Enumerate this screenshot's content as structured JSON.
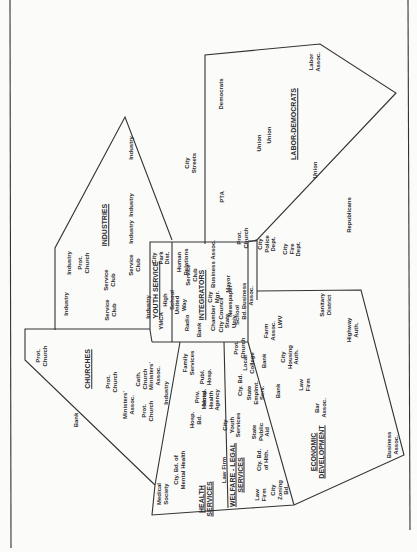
{
  "diagram": {
    "orientation": "rotated-90-ccw",
    "line_color": "#333333",
    "background": "#fbfbfa",
    "groups": [
      {
        "id": "industries",
        "title": "INDUSTRIES",
        "members": [
          "Industry",
          "Industry",
          "Industry",
          "Industry",
          "Industry",
          "Prot. Church",
          "Service Club",
          "Service Club",
          "Service Club"
        ]
      },
      {
        "id": "labor-democrats",
        "title": "LABOR-DEMOCRATS",
        "members": [
          "Democrats",
          "Union",
          "Union",
          "Union",
          "Labor Assoc.",
          "PTA"
        ]
      },
      {
        "id": "churches",
        "title": "CHURCHES",
        "members": [
          "Prot. Church",
          "Prot. Church",
          "Prot. Church",
          "Cath. Church",
          "Ministers' Assoc.",
          "Ministers' Assoc.",
          "Industry",
          "Bank",
          "Medical Society"
        ]
      },
      {
        "id": "youth-service",
        "title": "YOUTH SERVICE",
        "members": [
          "City Park Dist.",
          "High School",
          "United Way",
          "YMCA",
          "Industry"
        ]
      },
      {
        "id": "integrators",
        "title": "INTEGRATORS",
        "members": [
          "Human Relations",
          "Service Club",
          "Business Assoc.",
          "City Mgr.",
          "Mayor",
          "Chamber",
          "Newspaper",
          "City Council",
          "State Univ.",
          "School Bd.",
          "Business Assoc.",
          "Radio",
          "Bank",
          "Prot. Church"
        ]
      },
      {
        "id": "health-services",
        "title": "HEALTH SERVICES",
        "members": [
          "Medical Society",
          "Cty. Bd. of Mental Health",
          "Hosp. Bd.",
          "Priv. Hosp.",
          "Publ. Hosp.",
          "Family Services",
          "Mental Health Agency"
        ]
      },
      {
        "id": "welfare-legal",
        "title": "WELFARE-LEGAL SERVICES",
        "members": [
          "Law Firm",
          "Law Firm",
          "Cty. Bd. of Hlth.",
          "State Public Aid",
          "State Emplmt. Serv.",
          "City Youth Services",
          "Cty. Bd."
        ]
      },
      {
        "id": "economic-development",
        "title": "ECONOMIC DEVELOPMENT",
        "members": [
          "City Zoning Bd.",
          "Bar Assoc.",
          "Law Firm",
          "Bank",
          "City Housing Auth.",
          "Bank",
          "Farm Assoc.",
          "LWV",
          "Sanitary District",
          "Highway Auth.",
          "Business Assoc.",
          "Local College",
          "Prot. Church"
        ]
      }
    ],
    "ungrouped": [
      "City Streets",
      "City Police Dept.",
      "City Fire Dept.",
      "Republicans",
      "Prot. Church"
    ]
  },
  "labels": [
    {
      "text": "Industry",
      "x": 131,
      "y": 148
    },
    {
      "text": "City\nStreets",
      "x": 190,
      "y": 163
    },
    {
      "text": "INDUSTRIES",
      "x": 105,
      "y": 225,
      "title": true
    },
    {
      "text": "Industry",
      "x": 131,
      "y": 205
    },
    {
      "text": "Industry",
      "x": 131,
      "y": 232
    },
    {
      "text": "Industry",
      "x": 69,
      "y": 263
    },
    {
      "text": "Prot.\nChurch",
      "x": 83,
      "y": 263
    },
    {
      "text": "Service\nClub",
      "x": 109,
      "y": 280
    },
    {
      "text": "Service\nClub",
      "x": 134,
      "y": 265
    },
    {
      "text": "Industry",
      "x": 66,
      "y": 304
    },
    {
      "text": "Service\nClub",
      "x": 110,
      "y": 310
    },
    {
      "text": "Industry",
      "x": 148,
      "y": 307
    },
    {
      "text": "Democrats",
      "x": 221,
      "y": 94
    },
    {
      "text": "Union",
      "x": 259,
      "y": 143
    },
    {
      "text": "Union",
      "x": 269,
      "y": 135
    },
    {
      "text": "LABOR-DEMOCRATS",
      "x": 294,
      "y": 124,
      "title": true
    },
    {
      "text": "Union",
      "x": 315,
      "y": 170
    },
    {
      "text": "Labor\nAssoc.",
      "x": 314,
      "y": 62
    },
    {
      "text": "PTA",
      "x": 222,
      "y": 197
    },
    {
      "text": "Republicans",
      "x": 349,
      "y": 215
    },
    {
      "text": "City\nPolice\nDept.",
      "x": 267,
      "y": 244
    },
    {
      "text": "City\nFire\nDept.",
      "x": 292,
      "y": 249
    },
    {
      "text": "Prot.\nChurch",
      "x": 242,
      "y": 238
    },
    {
      "text": "City\nPark\nDist.",
      "x": 161,
      "y": 258
    },
    {
      "text": "Human\nRelations",
      "x": 182,
      "y": 262
    },
    {
      "text": "Service\nClub",
      "x": 191,
      "y": 275
    },
    {
      "text": "Business Assoc.",
      "x": 213,
      "y": 264
    },
    {
      "text": "YOUTH SERVICE",
      "x": 156,
      "y": 290,
      "title": true
    },
    {
      "text": "High\nSchool",
      "x": 168,
      "y": 300
    },
    {
      "text": "United\nWay",
      "x": 180,
      "y": 305
    },
    {
      "text": "YMCA",
      "x": 161,
      "y": 321
    },
    {
      "text": "INTEGRATORS",
      "x": 202,
      "y": 295,
      "title": true
    },
    {
      "text": "City\nMgr.",
      "x": 213,
      "y": 297
    },
    {
      "text": "Mayor",
      "x": 228,
      "y": 284
    },
    {
      "text": "Newspaper",
      "x": 230,
      "y": 301
    },
    {
      "text": "Radio",
      "x": 187,
      "y": 323
    },
    {
      "text": "Bank",
      "x": 199,
      "y": 330
    },
    {
      "text": "Chamber",
      "x": 213,
      "y": 318
    },
    {
      "text": "City Council",
      "x": 221,
      "y": 315
    },
    {
      "text": "State\nUniv.",
      "x": 230,
      "y": 321
    },
    {
      "text": "School\nBd.",
      "x": 240,
      "y": 315
    },
    {
      "text": "Business\nAssoc.",
      "x": 247,
      "y": 296
    },
    {
      "text": "Prot.\nChurch",
      "x": 41,
      "y": 356
    },
    {
      "text": "CHURCHES",
      "x": 88,
      "y": 369,
      "title": true
    },
    {
      "text": "Prot.\nChurch",
      "x": 111,
      "y": 382
    },
    {
      "text": "Bank",
      "x": 76,
      "y": 420
    },
    {
      "text": "Ministers'\nAssoc.",
      "x": 128,
      "y": 405
    },
    {
      "text": "Cath.\nChurch",
      "x": 141,
      "y": 379
    },
    {
      "text": "Ministers'\nAssoc.",
      "x": 154,
      "y": 376
    },
    {
      "text": "Prot.\nChurch",
      "x": 147,
      "y": 411
    },
    {
      "text": "Industry",
      "x": 166,
      "y": 393
    },
    {
      "text": "Family\nServices",
      "x": 188,
      "y": 363
    },
    {
      "text": "Hosp.\nBd.",
      "x": 195,
      "y": 420
    },
    {
      "text": "Priv.\nHosp.",
      "x": 200,
      "y": 397
    },
    {
      "text": "Publ.\nHosp.",
      "x": 205,
      "y": 377
    },
    {
      "text": "Mental\nHealth\nAgency",
      "x": 211,
      "y": 400
    },
    {
      "text": "Cty. Bd. of\nMental Health",
      "x": 179,
      "y": 470
    },
    {
      "text": "Medical\nSociety",
      "x": 162,
      "y": 494
    },
    {
      "text": "HEALTH\nSERVICES",
      "x": 205,
      "y": 499,
      "title": true
    },
    {
      "text": "City\nYouth\nServices",
      "x": 232,
      "y": 425
    },
    {
      "text": "Cty. Bd.",
      "x": 240,
      "y": 385
    },
    {
      "text": "State\nEmplmt.\nServ.",
      "x": 256,
      "y": 393
    },
    {
      "text": "State\nPublic\nAid",
      "x": 261,
      "y": 432
    },
    {
      "text": "Local\nCollege",
      "x": 248,
      "y": 363
    },
    {
      "text": "Prot.\nChurch",
      "x": 239,
      "y": 348
    },
    {
      "text": "Law Firm",
      "x": 224,
      "y": 470
    },
    {
      "text": "WELFARE - LEGAL\nSERVICES",
      "x": 236,
      "y": 475,
      "title": true
    },
    {
      "text": "Cty. Bd.\nof Hlth.",
      "x": 262,
      "y": 460
    },
    {
      "text": "Law\nFirm",
      "x": 260,
      "y": 495
    },
    {
      "text": "Farm\nAssoc.",
      "x": 269,
      "y": 331
    },
    {
      "text": "Bank",
      "x": 264,
      "y": 361
    },
    {
      "text": "LWV",
      "x": 280,
      "y": 322
    },
    {
      "text": "City\nHousing\nAuth.",
      "x": 290,
      "y": 357
    },
    {
      "text": "Bank",
      "x": 278,
      "y": 391
    },
    {
      "text": "Law\nFirm",
      "x": 304,
      "y": 385
    },
    {
      "text": "Bar\nAssoc.",
      "x": 320,
      "y": 408
    },
    {
      "text": "Sanitary\nDistrict",
      "x": 325,
      "y": 305
    },
    {
      "text": "Highway\nAuth.",
      "x": 352,
      "y": 330
    },
    {
      "text": "ECONOMIC\nDEVELOPMENT",
      "x": 317,
      "y": 452,
      "title": true
    },
    {
      "text": "City\nZoning\nBd.",
      "x": 280,
      "y": 490
    },
    {
      "text": "Business\nAssoc.",
      "x": 392,
      "y": 445
    }
  ]
}
